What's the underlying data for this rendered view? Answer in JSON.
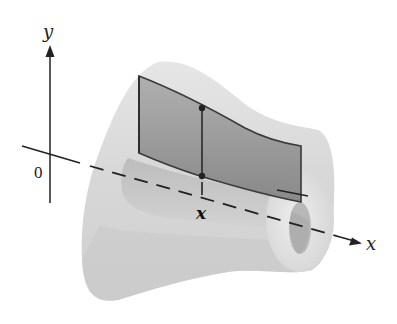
{
  "figure": {
    "type": "solid-of-revolution-cross-section",
    "labels": {
      "y_axis": "y",
      "x_axis": "x",
      "origin": "0",
      "x_marker": "x"
    },
    "colors": {
      "background": "#ffffff",
      "solid_outer": "#d9d9d9",
      "solid_shadow": "#bdbdbd",
      "inner_hole": "#c4c4c4",
      "rectangle_fill": "#8c8c8c",
      "lines": "#2a2a2a"
    }
  }
}
